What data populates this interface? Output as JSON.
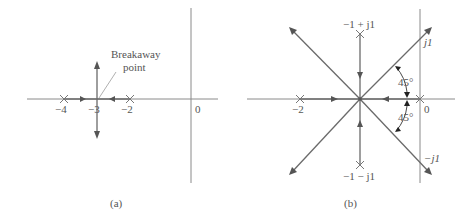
{
  "figure": {
    "panels": [
      {
        "id": "a",
        "caption": "(a)",
        "real_axis_labels": [
          "−4",
          "−3",
          "−2",
          "0"
        ],
        "poles": [
          -4,
          -2
        ],
        "breakaway_point": -3,
        "annotation": {
          "line1": "Breakaway",
          "line2": "point"
        }
      },
      {
        "id": "b",
        "caption": "(b)",
        "real_axis_labels": [
          "−2",
          "0"
        ],
        "poles": [
          "−2",
          "0",
          "−1 + j1",
          "−1 − j1"
        ],
        "pole_labels": {
          "upper": "−1 + j1",
          "lower": "−1 − j1"
        },
        "imag_axis_labels": {
          "top": "j1",
          "bottom": "−j1"
        },
        "angle_labels": [
          "45°",
          "45°"
        ],
        "centroid": -1
      }
    ]
  },
  "colors": {
    "axis": "#8a8a8a",
    "locus": "#6a6a6a",
    "arrow": "#555555",
    "text": "#555555"
  }
}
